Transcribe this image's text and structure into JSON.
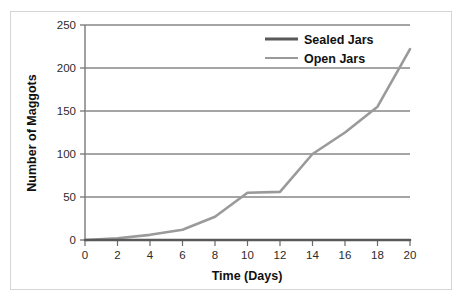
{
  "chart_data": {
    "type": "line",
    "title": "",
    "xlabel": "Time (Days)",
    "ylabel": "Number of Maggots",
    "xlim": [
      0,
      20
    ],
    "ylim": [
      0,
      250
    ],
    "xticks": [
      0,
      2,
      4,
      6,
      8,
      10,
      12,
      14,
      16,
      18,
      20
    ],
    "yticks": [
      0,
      50,
      100,
      150,
      200,
      250
    ],
    "grid": "horizontal",
    "legend_position": "top-right",
    "x": [
      0,
      2,
      4,
      6,
      8,
      10,
      12,
      14,
      16,
      18,
      20
    ],
    "series": [
      {
        "name": "Sealed Jars",
        "color": "#595959",
        "values": [
          0,
          0,
          0,
          0,
          0,
          0,
          0,
          0,
          0,
          0,
          0
        ]
      },
      {
        "name": "Open Jars",
        "color": "#9a9a9a",
        "values": [
          0,
          2,
          6,
          12,
          27,
          55,
          56,
          100,
          125,
          155,
          222
        ]
      }
    ]
  },
  "axes": {
    "y_tick_labels": [
      "250",
      "200",
      "150",
      "100",
      "50",
      "0"
    ],
    "x_tick_labels": [
      "0",
      "2",
      "4",
      "6",
      "8",
      "10",
      "12",
      "14",
      "16",
      "18",
      "20"
    ],
    "x_axis_title": "Time (Days)",
    "y_axis_title": "Number of Maggots"
  },
  "legend": {
    "items": [
      {
        "label": "Sealed Jars",
        "color": "#595959"
      },
      {
        "label": "Open Jars",
        "color": "#9a9a9a"
      }
    ]
  },
  "style": {
    "grid_color": "#4a4a4a",
    "axis_color": "#8a8a8a",
    "frame_color": "#d5d5d5",
    "background": "#ffffff"
  }
}
